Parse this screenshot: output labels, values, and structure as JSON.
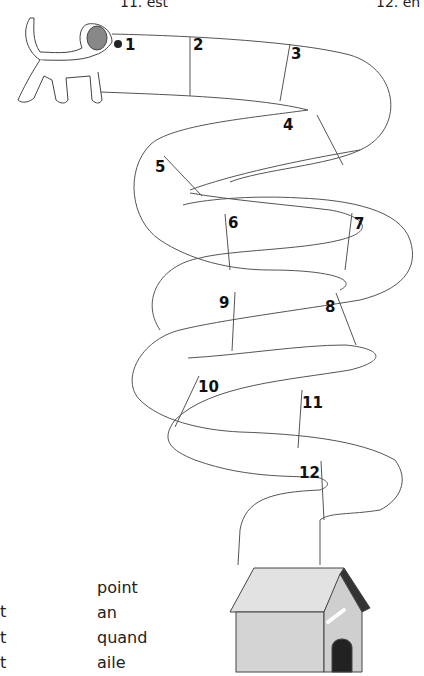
{
  "worksheet": {
    "top_labels": [
      "11. est",
      "12. en"
    ],
    "squares": [
      "1",
      "2",
      "3",
      "4",
      "5",
      "6",
      "7",
      "8",
      "9",
      "10",
      "11",
      "12"
    ],
    "word_list": {
      "left_column_partial": [
        "t",
        "t",
        "t"
      ],
      "right_column": [
        "point",
        "an",
        "quand",
        "aile"
      ]
    },
    "images": {
      "start": "dog",
      "end": "doghouse"
    }
  }
}
